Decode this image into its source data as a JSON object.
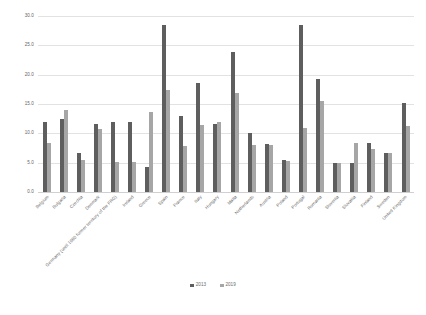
{
  "chart_data": {
    "type": "bar",
    "title": "",
    "subtitle": "",
    "xlabel": "",
    "ylabel": "",
    "ylim": [
      0.0,
      30.0
    ],
    "ytick_step": 5.0,
    "yticks": [
      "0.0",
      "5.0",
      "10.0",
      "15.0",
      "20.0",
      "25.0",
      "30.0"
    ],
    "grid": true,
    "legend_position": "bottom-center",
    "categories": [
      "Belgium",
      "Bulgaria",
      "Czechia",
      "Denmark",
      "Germany (until 1990 former territory of the FRG)",
      "Ireland",
      "Greece",
      "Spain",
      "France",
      "Italy",
      "Hungary",
      "Malta",
      "Netherlands",
      "Austria",
      "Poland",
      "Portugal",
      "Romania",
      "Slovenia",
      "Slovakia",
      "Finland",
      "Sweden",
      "United Kingdom"
    ],
    "series": [
      {
        "name": "2013",
        "color": "#5e5e5e",
        "values": [
          11.9,
          12.4,
          6.6,
          11.6,
          12.0,
          12.0,
          4.2,
          28.5,
          12.9,
          18.6,
          11.6,
          23.8,
          10.1,
          8.1,
          5.4,
          28.5,
          19.3,
          5.0,
          5.0,
          8.4,
          6.6,
          15.1
        ]
      },
      {
        "name": "2019",
        "color": "#a6a6a6",
        "values": [
          8.4,
          14.0,
          5.4,
          10.8,
          5.2,
          5.2,
          13.6,
          17.4,
          7.8,
          11.5,
          12.0,
          16.8,
          8.0,
          8.0,
          5.3,
          10.9,
          15.5,
          4.9,
          8.4,
          7.3,
          6.6,
          11.2
        ]
      }
    ],
    "legend": [
      {
        "label": "2013",
        "color": "#5e5e5e"
      },
      {
        "label": "2019",
        "color": "#a6a6a6"
      }
    ]
  }
}
